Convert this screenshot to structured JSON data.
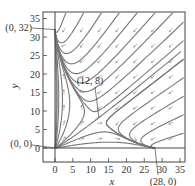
{
  "figure": {
    "type": "phase-plane",
    "x_axis": {
      "label": "x",
      "ticks": [
        "0",
        "5",
        "10",
        "15",
        "20",
        "25",
        "30",
        "35"
      ],
      "range": [
        -1.5,
        36
      ]
    },
    "y_axis": {
      "label": "y",
      "ticks": [
        "0",
        "5",
        "10",
        "15",
        "20",
        "25",
        "30",
        "35"
      ],
      "range": [
        -3.5,
        37
      ]
    },
    "equilibria": [
      {
        "label": "(0, 0)",
        "x": 0,
        "y": 0
      },
      {
        "label": "(0, 32)",
        "x": 0,
        "y": 32
      },
      {
        "label": "(12, 8)",
        "x": 12,
        "y": 8
      },
      {
        "label": "(28, 0)",
        "x": 28,
        "y": 0
      }
    ],
    "colors": {
      "trajectory": "#777777",
      "arrow": "#888888",
      "axis": "#444444",
      "text": "#333333"
    }
  }
}
